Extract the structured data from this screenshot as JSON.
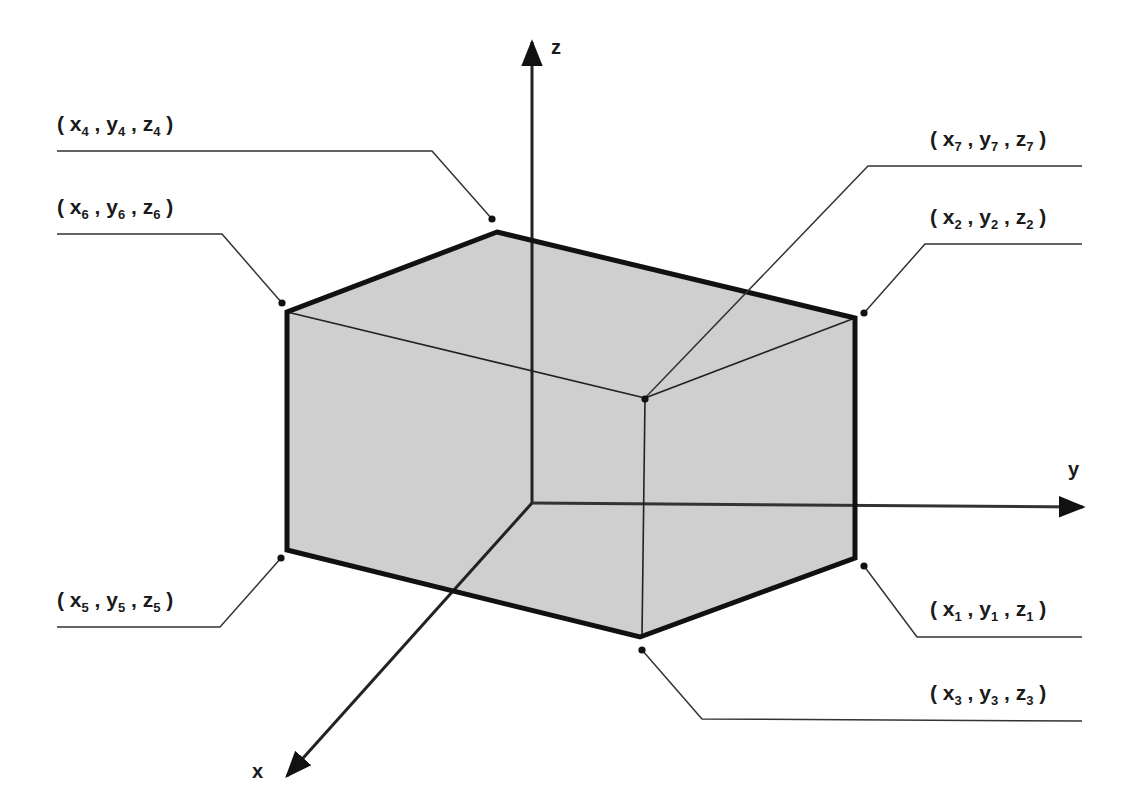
{
  "diagram": {
    "type": "3D rectangular box with labeled vertices on x-y-z axes",
    "colors": {
      "face_fill": "#cfcfcf",
      "edge": "#111111",
      "axis": "#111111",
      "background": "#ffffff"
    },
    "axes": {
      "x": {
        "label": "x"
      },
      "y": {
        "label": "y"
      },
      "z": {
        "label": "z"
      }
    },
    "vertices": [
      {
        "id": 1,
        "var": "x",
        "sub": "1",
        "var2": "y",
        "var3": "z"
      },
      {
        "id": 2
      },
      {
        "id": 3
      },
      {
        "id": 4
      },
      {
        "id": 5
      },
      {
        "id": 6
      },
      {
        "id": 7
      }
    ],
    "labels": {
      "v1": {
        "x": "x",
        "y": "y",
        "z": "z",
        "n": "1"
      },
      "v2": {
        "x": "x",
        "y": "y",
        "z": "z",
        "n": "2"
      },
      "v3": {
        "x": "x",
        "y": "y",
        "z": "z",
        "n": "3"
      },
      "v4": {
        "x": "x",
        "y": "y",
        "z": "z",
        "n": "4"
      },
      "v5": {
        "x": "x",
        "y": "y",
        "z": "z",
        "n": "5"
      },
      "v6": {
        "x": "x",
        "y": "y",
        "z": "z",
        "n": "6"
      },
      "v7": {
        "x": "x",
        "y": "y",
        "z": "z",
        "n": "7"
      }
    },
    "punct": {
      "open": "( ",
      "comma": " , ",
      "close": " )"
    }
  }
}
